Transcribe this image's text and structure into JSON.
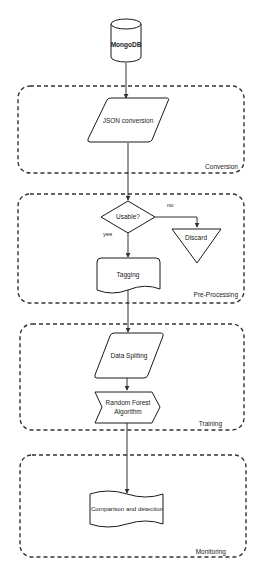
{
  "diagram": {
    "type": "flowchart",
    "nodes": {
      "mongodb": {
        "label": "MongoDB",
        "shape": "cylinder"
      },
      "json_conversion": {
        "label": "JSON conversion",
        "shape": "parallelogram"
      },
      "usable": {
        "label": "Usable?",
        "shape": "diamond"
      },
      "discard": {
        "label": "Discard",
        "shape": "inverted-triangle"
      },
      "tagging": {
        "label": "Tagging",
        "shape": "document"
      },
      "data_spliting": {
        "label": "Data Spliting",
        "shape": "parallelogram"
      },
      "random_forest": {
        "label_line1": "Random Forest",
        "label_line2": "Algorithm",
        "shape": "step"
      },
      "comparison": {
        "label": "Comparison and detection",
        "shape": "tape"
      }
    },
    "groups": {
      "conversion": {
        "label": "Conversion"
      },
      "preprocessing": {
        "label": "Pre-Processing"
      },
      "training": {
        "label": "Training"
      },
      "monitoring": {
        "label": "Monitoring"
      }
    },
    "edges": {
      "usable_no": {
        "from": "Usable?",
        "to": "Discard",
        "label": "no"
      },
      "usable_yes": {
        "from": "Usable?",
        "to": "Tagging",
        "label": "yes"
      }
    },
    "edge_list": [
      "MongoDB -> JSON conversion",
      "JSON conversion -> Usable?",
      "Usable? -> Discard (no)",
      "Usable? -> Tagging (yes)",
      "Tagging -> Data Spliting",
      "Data Spliting -> Random Forest Algorithm",
      "Random Forest Algorithm -> Comparison and detection"
    ]
  }
}
